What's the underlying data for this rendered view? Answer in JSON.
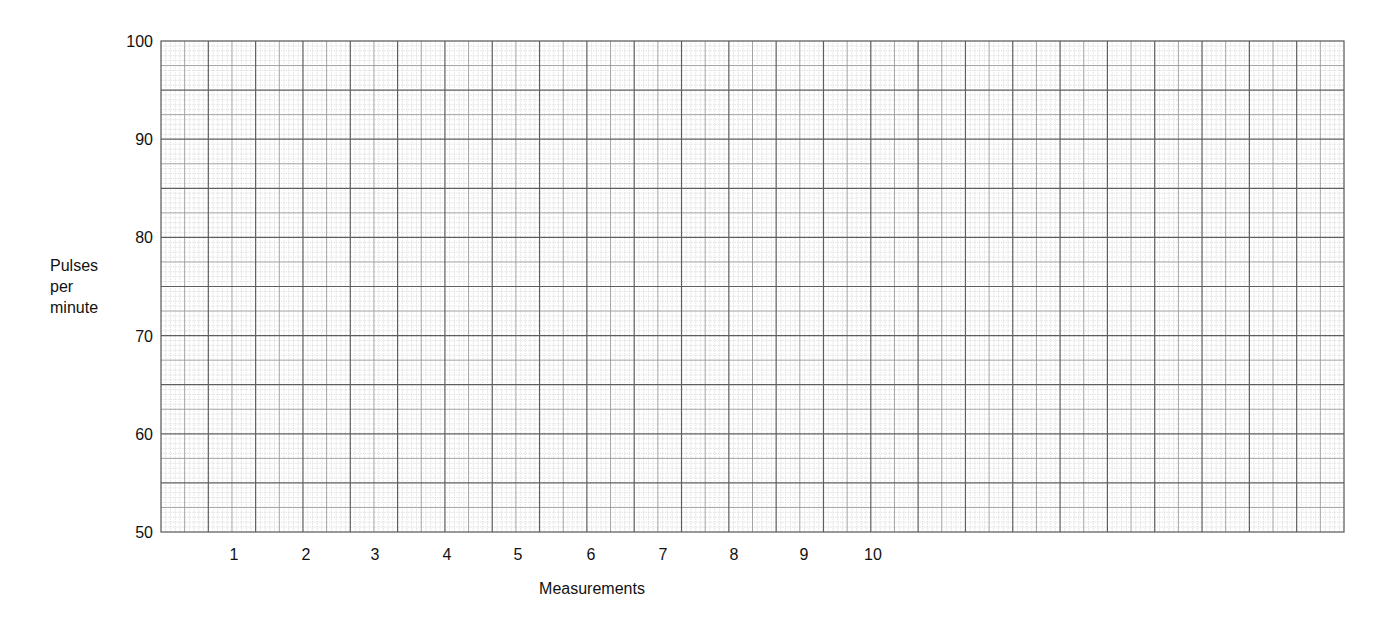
{
  "chart_data": {
    "type": "line",
    "title": "",
    "xlabel": "Measurements",
    "ylabel": [
      "Pulses",
      "per",
      "minute"
    ],
    "x": [
      1,
      2,
      3,
      4,
      5,
      6,
      7,
      8,
      9,
      10
    ],
    "x_tick_labels": [
      "1",
      "2",
      "3",
      "4",
      "5",
      "6",
      "7",
      "8",
      "9",
      "10"
    ],
    "y_tick_labels": [
      "100",
      "90",
      "80",
      "70",
      "60",
      "50"
    ],
    "y_ticks": [
      100,
      90,
      80,
      70,
      60,
      50
    ],
    "ylim": [
      50,
      100
    ],
    "series": [],
    "grid": true,
    "legend": null,
    "note": "Blank graph-paper worksheet; no data plotted"
  },
  "grid": {
    "left": 161,
    "top": 41,
    "right": 1344,
    "bottom": 532,
    "x_cells": 50,
    "y_cells": 20,
    "fine_subdivisions": 5,
    "colors": {
      "fine": "#cfcfcf",
      "medium": "#9a9a9a",
      "major": "#5e5e5e",
      "border": "#555555"
    }
  },
  "label_positions": {
    "x_tick_centers": [
      234,
      306,
      375,
      447,
      518,
      591,
      663,
      734,
      804,
      873
    ],
    "x_tick_y": 560,
    "x_title": {
      "x": 592,
      "y": 594
    },
    "y_title": {
      "x": 50,
      "y": [
        271,
        292,
        313
      ]
    }
  }
}
